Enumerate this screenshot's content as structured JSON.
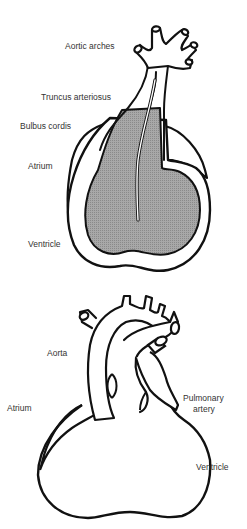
{
  "figures": [
    {
      "id": "embryonic-heart",
      "labels": [
        {
          "text": "Aortic arches",
          "x": 65,
          "y": 41
        },
        {
          "text": "Truncus arteriosus",
          "x": 41,
          "y": 91
        },
        {
          "text": "Bulbus cordis",
          "x": 20,
          "y": 121
        },
        {
          "text": "Atrium",
          "x": 28,
          "y": 162
        },
        {
          "text": "Ventricle",
          "x": 28,
          "y": 238
        }
      ]
    },
    {
      "id": "adult-heart",
      "labels": [
        {
          "text": "Aorta",
          "x": 47,
          "y": 348
        },
        {
          "text": "Atrium",
          "x": 7,
          "y": 403
        },
        {
          "text": "Pulmonary",
          "x": 183,
          "y": 393
        },
        {
          "text": "artery",
          "x": 193,
          "y": 404
        },
        {
          "text": "Ventricle",
          "x": 196,
          "y": 462
        }
      ]
    }
  ],
  "colors": {
    "outline": "#111111",
    "fill_shaded": "#9a9a9a",
    "label_text": "#333333",
    "background": "#ffffff"
  }
}
